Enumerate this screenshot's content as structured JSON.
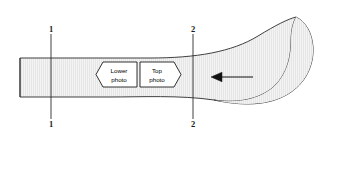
{
  "figure": {
    "background_color": "#ffffff",
    "band": {
      "fill_color": "#e4e4e4",
      "hatch_color": "#f7f7f7",
      "outline_color": "#2b2b2b",
      "outline_width": 0.9
    },
    "section_lines": [
      {
        "id": "section-line-1",
        "label": "1",
        "top_label": "1",
        "bottom_label": "1",
        "x": 51,
        "y_top": 34,
        "y_bottom": 119,
        "label_top_y": 32,
        "label_bottom_y": 127,
        "color": "#2b2b2b"
      },
      {
        "id": "section-line-2",
        "label": "2",
        "top_label": "2",
        "bottom_label": "2",
        "x": 193,
        "y_top": 34,
        "y_bottom": 119,
        "label_top_y": 32,
        "label_bottom_y": 127,
        "color": "#2b2b2b"
      }
    ],
    "callouts": [
      {
        "id": "callout-lower-photo",
        "line1": "Lower",
        "line2": "photo",
        "direction": "left",
        "x": 96,
        "y": 62,
        "width": 41,
        "height": 25,
        "fill": "#ffffff",
        "stroke": "#000000"
      },
      {
        "id": "callout-top-photo",
        "line1": "Top",
        "line2": "photo",
        "direction": "right",
        "x": 140,
        "y": 62,
        "width": 41,
        "height": 25,
        "fill": "#ffffff",
        "stroke": "#000000"
      }
    ],
    "arrow": {
      "id": "direction-arrow",
      "direction": "left",
      "tip_x": 211,
      "tail_x": 253,
      "y": 77,
      "color": "#111111",
      "head_length": 9,
      "head_half_width": 4,
      "shaft_width": 1.1
    }
  }
}
